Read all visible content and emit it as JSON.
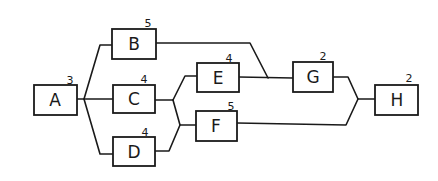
{
  "diagram": {
    "type": "activity-on-node network",
    "nodes": [
      {
        "id": "A",
        "label": "A",
        "duration": "3"
      },
      {
        "id": "B",
        "label": "B",
        "duration": "5"
      },
      {
        "id": "C",
        "label": "C",
        "duration": "4"
      },
      {
        "id": "D",
        "label": "D",
        "duration": "4"
      },
      {
        "id": "E",
        "label": "E",
        "duration": "4"
      },
      {
        "id": "F",
        "label": "F",
        "duration": "5"
      },
      {
        "id": "G",
        "label": "G",
        "duration": "2"
      },
      {
        "id": "H",
        "label": "H",
        "duration": "2"
      }
    ],
    "edges": [
      {
        "from": "A",
        "to": "B"
      },
      {
        "from": "A",
        "to": "C"
      },
      {
        "from": "A",
        "to": "D"
      },
      {
        "from": "B",
        "to": "G"
      },
      {
        "from": "C",
        "to": "E"
      },
      {
        "from": "C",
        "to": "F"
      },
      {
        "from": "D",
        "to": "E"
      },
      {
        "from": "D",
        "to": "F"
      },
      {
        "from": "E",
        "to": "G"
      },
      {
        "from": "G",
        "to": "H"
      },
      {
        "from": "F",
        "to": "H"
      }
    ]
  }
}
